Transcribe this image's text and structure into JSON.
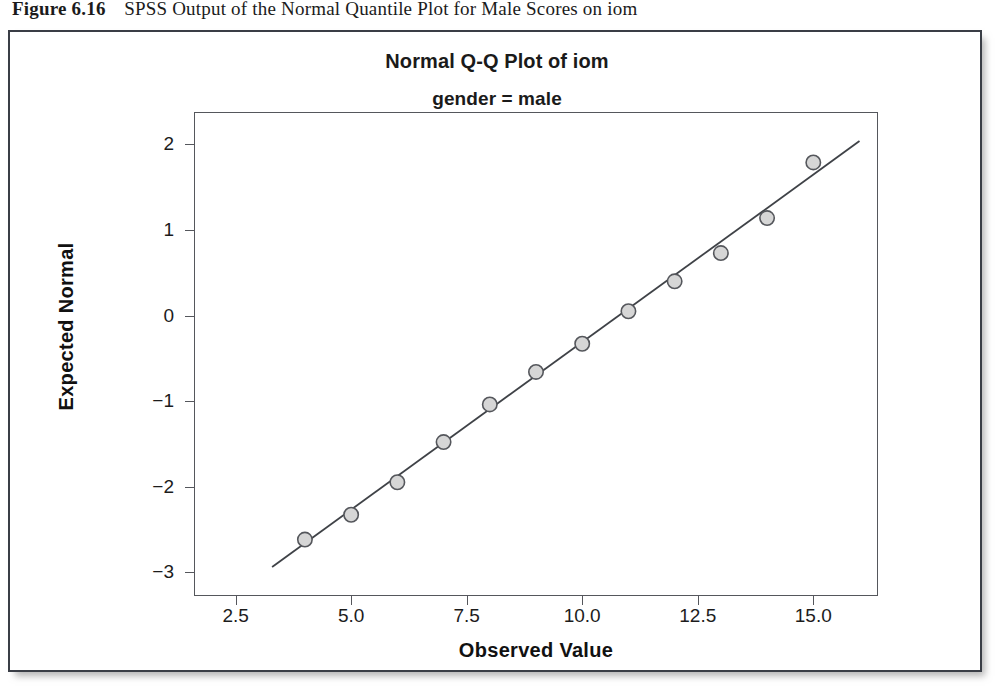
{
  "caption": {
    "label": "Figure 6.16",
    "text": "SPSS Output of the Normal Quantile Plot for Male Scores on iom"
  },
  "chart_data": {
    "type": "scatter",
    "title": "Normal Q-Q Plot of iom",
    "subtitle": "gender = male",
    "xlabel": "Observed Value",
    "ylabel": "Expected Normal",
    "xlim": [
      1.6,
      16.4
    ],
    "ylim": [
      -3.28,
      2.38
    ],
    "xticks": [
      2.5,
      5.0,
      7.5,
      10.0,
      12.5,
      15.0
    ],
    "xticklabels": [
      "2.5",
      "5.0",
      "7.5",
      "10.0",
      "12.5",
      "15.0"
    ],
    "yticks": [
      -3,
      -2,
      -1,
      0,
      1,
      2
    ],
    "yticklabels": [
      "-3",
      "-2",
      "-1",
      "0",
      "1",
      "2"
    ],
    "grid": false,
    "legend": false,
    "marker_face_color": "#d6d6d6",
    "marker_edge_color": "#55575c",
    "line_color": "#3f4247",
    "series": [
      {
        "name": "iom male",
        "x": [
          4,
          5,
          6,
          7,
          8,
          9,
          10,
          11,
          12,
          13,
          14,
          15
        ],
        "y": [
          -2.62,
          -2.33,
          -1.95,
          -1.48,
          -1.04,
          -0.66,
          -0.33,
          0.05,
          0.4,
          0.73,
          1.14,
          1.79
        ]
      }
    ],
    "reference_line": {
      "name": "normal-reference-line",
      "x": [
        3.29,
        16.0
      ],
      "y": [
        -2.94,
        2.04
      ]
    }
  }
}
